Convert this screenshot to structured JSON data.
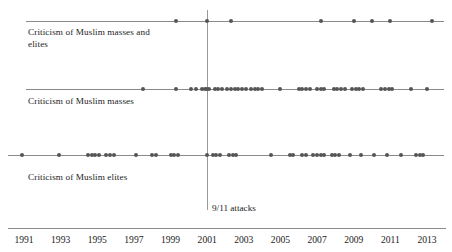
{
  "chart_data": {
    "type": "scatter",
    "title": "",
    "subtitle": "",
    "xlabel": "",
    "ylabel": "",
    "xlim": [
      1990.2,
      2013.6
    ],
    "grid": false,
    "legend_position": "none",
    "x_tick_labels": [
      "1991",
      "1993",
      "1995",
      "1997",
      "1999",
      "2001",
      "2003",
      "2005",
      "2007",
      "2009",
      "2011",
      "2013"
    ],
    "x_tick_values": [
      1991,
      1993,
      1995,
      1997,
      1999,
      2001,
      2003,
      2005,
      2007,
      2009,
      2011,
      2013
    ],
    "annotations": [
      {
        "label": "9/11 attacks",
        "x": 2001.0,
        "type": "vertical-line"
      }
    ],
    "categories": [
      "Criticism of Muslim masses and elites",
      "Criticism of Muslim masses",
      "Criticism of Muslim elites"
    ],
    "series": [
      {
        "name": "Criticism of Muslim masses and elites",
        "row": 0,
        "count": 9,
        "x": [
          1999.3,
          2001.0,
          2002.3,
          2007.2,
          2009.0,
          2010.0,
          2011.0,
          2013.3
        ]
      },
      {
        "name": "Criticism of Muslim masses",
        "row": 1,
        "count": 57,
        "x": [
          1997.5,
          1999.3,
          2000.1,
          2000.4,
          2000.7,
          2000.9,
          2001.0,
          2001.1,
          2001.4,
          2001.6,
          2001.8,
          2002.1,
          2002.3,
          2002.5,
          2002.7,
          2002.9,
          2003.1,
          2003.4,
          2003.6,
          2003.8,
          2004.0,
          2005.0,
          2006.0,
          2006.2,
          2006.4,
          2006.6,
          2007.0,
          2007.2,
          2007.4,
          2007.9,
          2008.1,
          2008.3,
          2008.5,
          2008.9,
          2009.1,
          2009.3,
          2009.5,
          2010.5,
          2010.7,
          2010.9,
          2011.1,
          2012.1,
          2013.0
        ]
      },
      {
        "name": "Criticism of Muslim elites",
        "row": 2,
        "count": 62,
        "x": [
          1990.9,
          1992.9,
          1994.5,
          1994.7,
          1994.9,
          1995.1,
          1995.5,
          1995.7,
          1995.9,
          1997.1,
          1998.0,
          1998.2,
          1999.0,
          1999.2,
          1999.4,
          2001.0,
          2001.3,
          2001.5,
          2001.7,
          2002.2,
          2002.4,
          2002.6,
          2004.5,
          2005.5,
          2005.7,
          2006.2,
          2006.4,
          2006.8,
          2007.0,
          2007.2,
          2007.4,
          2007.8,
          2008.0,
          2008.2,
          2008.8,
          2009.4,
          2010.1,
          2010.8,
          2011.6,
          2012.4,
          2012.6,
          2012.8
        ]
      }
    ]
  },
  "figure": {
    "lanes": [
      {
        "id": "lane-masses-and-elites",
        "label": "Criticism of Muslim masses and\nelites"
      },
      {
        "id": "lane-masses",
        "label": "Criticism of Muslim masses"
      },
      {
        "id": "lane-elites",
        "label": "Criticism of Muslim elites"
      }
    ],
    "event_marker_label": "9/11 attacks",
    "colors": {
      "dot": "#555555",
      "line": "#8a8a8a",
      "event_line": "#9a9a9a",
      "text": "#1c1c1c",
      "background": "#ffffff"
    }
  }
}
